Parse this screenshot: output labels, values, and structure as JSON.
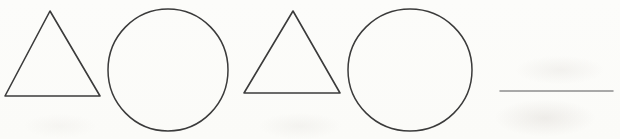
{
  "image": {
    "description": "Scanned worksheet showing a repeating shape pattern: triangle, circle, triangle, circle, followed by a blank answer line",
    "width": 620,
    "height": 139,
    "background_color": "#fcfcfa",
    "ink_color": "#3b3b3b",
    "line_color": "#8d8d8d"
  },
  "pattern": {
    "sequence_label": "triangle, circle, triangle, circle, blank",
    "shapes": [
      {
        "name": "triangle-1",
        "type": "triangle",
        "stroke": "#3b3b3b",
        "stroke_width": 1.6,
        "points": "50,11 100,96 5,96"
      },
      {
        "name": "circle-1",
        "type": "circle",
        "stroke": "#3b3b3b",
        "stroke_width": 1.5,
        "cx": 168,
        "cy": 70,
        "rx": 60,
        "ry": 61
      },
      {
        "name": "triangle-2",
        "type": "triangle",
        "stroke": "#3b3b3b",
        "stroke_width": 1.6,
        "points": "293,11 340,93 244,93"
      },
      {
        "name": "circle-2",
        "type": "circle",
        "stroke": "#3b3b3b",
        "stroke_width": 1.5,
        "cx": 410,
        "cy": 70,
        "rx": 62,
        "ry": 61
      },
      {
        "name": "answer-line",
        "type": "line",
        "stroke": "#8d8d8d",
        "stroke_width": 1.5,
        "x1": 500,
        "y1": 91,
        "x2": 613,
        "y2": 91
      }
    ]
  }
}
